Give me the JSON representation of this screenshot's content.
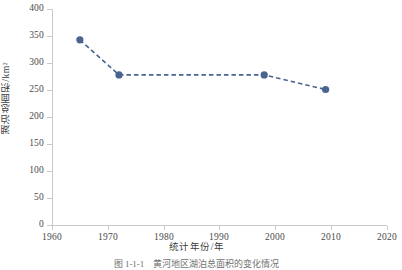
{
  "figure": {
    "caption_number": "图 1-1-1",
    "caption_text": "黄河地区湖泊总面积的变化情况"
  },
  "chart_data": {
    "type": "line",
    "title": "",
    "xlabel": "统计年份/年",
    "ylabel": "湖泊总面积/km²",
    "xlim": [
      1960,
      2020
    ],
    "ylim": [
      0,
      400
    ],
    "xticks": [
      1960,
      1970,
      1980,
      1990,
      2000,
      2010,
      2020
    ],
    "xtick_labels": [
      "1960",
      "1970",
      "1980",
      "1990",
      "2000",
      "2010",
      "2020"
    ],
    "yticks": [
      0,
      50,
      100,
      150,
      200,
      250,
      300,
      350,
      400
    ],
    "ytick_labels": [
      "0",
      "50",
      "100",
      "150",
      "200",
      "250",
      "300",
      "350",
      "400"
    ],
    "grid": false,
    "legend": null,
    "line_style": "dashed",
    "marker": "circle",
    "series_color": "#4A6491",
    "axis_color": "#C9C9C9",
    "x": [
      1965,
      1972,
      1998,
      2009
    ],
    "values": [
      343,
      278,
      278,
      251
    ],
    "points": [
      {
        "x": 1965,
        "y": 343
      },
      {
        "x": 1972,
        "y": 278
      },
      {
        "x": 1998,
        "y": 278
      },
      {
        "x": 2009,
        "y": 251
      }
    ],
    "series": [
      {
        "name": "湖泊总面积",
        "x": [
          1965,
          1972,
          1998,
          2009
        ],
        "values": [
          343,
          278,
          278,
          251
        ]
      }
    ]
  }
}
